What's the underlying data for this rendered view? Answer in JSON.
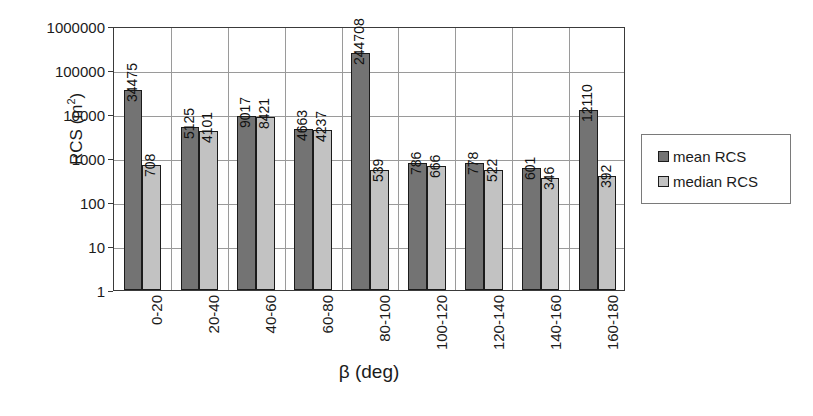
{
  "chart_data": {
    "type": "bar",
    "title": "",
    "xlabel": "β (deg)",
    "ylabel": "RCS (m²)",
    "ylabel_base": "RCS (m",
    "ylabel_sup": "2",
    "ylabel_tail": ")",
    "yscale": "log",
    "ylim": [
      1,
      1000000
    ],
    "grid": true,
    "legend_position": "right",
    "categories": [
      "0-20",
      "20-40",
      "40-60",
      "60-80",
      "80-100",
      "100-120",
      "120-140",
      "140-160",
      "160-180"
    ],
    "yticks": [
      "1000000",
      "100000",
      "10000",
      "1000",
      "100",
      "10",
      "1"
    ],
    "ytick_values": [
      1000000,
      100000,
      10000,
      1000,
      100,
      10,
      1
    ],
    "series": [
      {
        "name": "mean RCS",
        "color": "#737373",
        "values": [
          34475,
          5125,
          9017,
          4663,
          244708,
          786,
          778,
          601,
          12110
        ],
        "labels": [
          "34475",
          "5125",
          "9017",
          "4663",
          "244708",
          "786",
          "778",
          "601",
          "12110"
        ]
      },
      {
        "name": "median RCS",
        "color": "#c2c2c2",
        "values": [
          708,
          4101,
          8421,
          4237,
          539,
          666,
          522,
          346,
          392
        ],
        "labels": [
          "708",
          "4101",
          "8421",
          "4237",
          "539",
          "666",
          "522",
          "346",
          "392"
        ]
      }
    ]
  },
  "legend": {
    "items": [
      {
        "label": "mean RCS",
        "swatch": "mean"
      },
      {
        "label": "median RCS",
        "swatch": "median"
      }
    ]
  }
}
